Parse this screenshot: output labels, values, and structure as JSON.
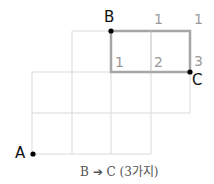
{
  "diagram": {
    "points": {
      "A": "A",
      "B": "B",
      "C": "C"
    },
    "path_counts": {
      "top_1": "1",
      "top_2": "1",
      "mid_1": "1",
      "mid_2": "2",
      "mid_3": "3"
    },
    "caption": "B ➔ C (3가지)",
    "colors": {
      "grid": "#d9d9d9",
      "highlight": "#a6a6a6",
      "numbers": "#9a9a9a",
      "dots": "#000000"
    }
  }
}
